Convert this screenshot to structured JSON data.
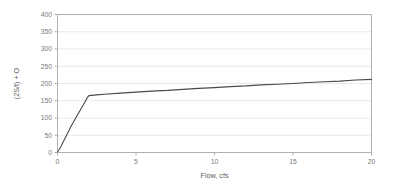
{
  "chart_data": {
    "type": "line",
    "title": "",
    "xlabel": "Flow, cfs",
    "ylabel": "(2S/t) + O",
    "xlim": [
      0,
      20
    ],
    "ylim": [
      0,
      400
    ],
    "xticks": [
      0,
      5,
      10,
      15,
      20
    ],
    "yticks": [
      0,
      50,
      100,
      150,
      200,
      250,
      300,
      350,
      400
    ],
    "xtick_labels": [
      "0",
      "5",
      "10",
      "15",
      "20"
    ],
    "ytick_labels": [
      "0",
      "50",
      "100",
      "150",
      "200",
      "250",
      "300",
      "350",
      "400"
    ],
    "grid": "horizontal",
    "legend": "none",
    "series": [
      {
        "name": "storage-indication-curve",
        "color": "#4a4a4a",
        "line_width": 1.1,
        "x": [
          0.0,
          0.1,
          0.2,
          0.3,
          0.4,
          0.5,
          0.6,
          0.7,
          0.8,
          0.9,
          1.0,
          1.1,
          1.2,
          1.3,
          1.4,
          1.5,
          1.6,
          1.7,
          1.8,
          1.9,
          1.95,
          2.0,
          2.5,
          3.0,
          4.0,
          5.0,
          6.0,
          7.0,
          8.0,
          9.0,
          10.0,
          11.0,
          12.0,
          13.0,
          14.0,
          15.0,
          16.0,
          17.0,
          18.0,
          19.0,
          20.0
        ],
        "y": [
          2,
          8,
          16,
          25,
          34,
          43,
          52,
          61,
          70,
          79,
          87,
          95,
          103,
          111,
          119,
          127,
          135,
          143,
          151,
          159,
          162,
          165,
          167,
          169,
          172,
          175,
          178,
          180,
          183,
          186,
          188,
          191,
          193,
          196,
          198,
          200,
          203,
          205,
          207,
          210,
          212
        ]
      }
    ],
    "annotations": {
      "knee_point": {
        "x": 2.0,
        "y": 165
      },
      "end_point": {
        "x": 20.0,
        "y": 212
      },
      "start_point": {
        "x": 0.0,
        "y": 2
      }
    },
    "style": {
      "plot_background": "#ffffff",
      "grid_color": "#e8e8e8",
      "axis_color": "#b0b0b0",
      "tick_label_color": "#7a7a7a",
      "axis_title_color": "#5e5e5e",
      "line_color": "#4a4a4a"
    }
  }
}
